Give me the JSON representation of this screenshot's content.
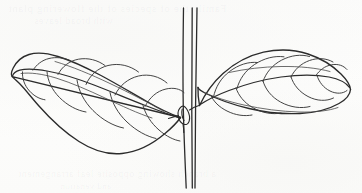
{
  "figure": {
    "medium": "pen-and-ink contour drawing",
    "background_color": "#fcfcfb",
    "ink_color": "#2b2b2b",
    "width_px": 362,
    "height_px": 193
  },
  "bleed_through": {
    "note": "faint mirrored text showing through from the reverse of the page",
    "top_line_1": "Family the of species of the flowering plant",
    "top_line_2": "with broad leaves",
    "bottom_line_1": "a branch showing opposite leaf arrangement",
    "bottom_line_2": "and venation"
  },
  "subject": {
    "stem": {
      "name": "vertical stem",
      "orientation": "vertical",
      "line_count": 3,
      "top_y": 8,
      "bottom_y": 188,
      "x_at_top": [
        183,
        192,
        197
      ],
      "x_at_bottom": [
        186,
        192,
        195
      ]
    },
    "node": {
      "name": "leaf node",
      "x": 186,
      "y": 112,
      "description": "small swollen bud at the junction of both petioles"
    },
    "leaves": [
      {
        "id": "left-leaf",
        "side": "left",
        "shape": "lanceolate-oblong",
        "tip_direction": "points left and slightly upward",
        "tip_x": 12,
        "tip_y": 76,
        "base_x": 180,
        "base_y": 118,
        "lateral_vein_pairs": 5,
        "has_midrib": true
      },
      {
        "id": "right-leaf",
        "side": "right",
        "shape": "obovate-oblong",
        "tip_direction": "points right, broadly rounded apex",
        "tip_x": 350,
        "tip_y": 82,
        "base_x": 200,
        "base_y": 106,
        "lateral_vein_pairs": 5,
        "has_midrib": true
      }
    ]
  }
}
